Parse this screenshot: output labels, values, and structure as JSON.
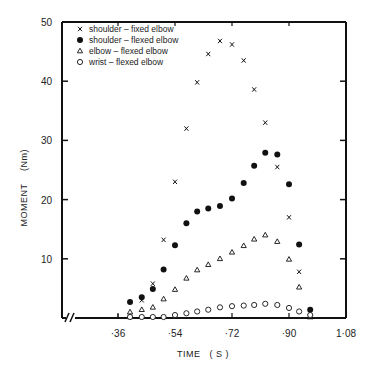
{
  "chart_data": {
    "type": "scatter",
    "title": "",
    "xlabel": "TIME   ( S )",
    "ylabel": "MOMENT     (Nm)",
    "xlim": [
      0.27,
      1.08
    ],
    "ylim": [
      0,
      50
    ],
    "x_ticks": [
      0.36,
      0.54,
      0.72,
      0.9,
      1.08
    ],
    "x_tick_labels": [
      "·36",
      "·54",
      "·72",
      "·90",
      "1·08"
    ],
    "y_ticks": [
      10,
      20,
      30,
      40,
      50
    ],
    "y_tick_labels": [
      "10",
      "20",
      "30",
      "40",
      "50"
    ],
    "axis_break": "x-axis broken near origin (//)",
    "grid": false,
    "legend_position": "upper left (inside)",
    "series": [
      {
        "name": "shoulder - fixed elbow",
        "marker": "x",
        "x": [
          0.398,
          0.435,
          0.47,
          0.504,
          0.54,
          0.576,
          0.61,
          0.645,
          0.682,
          0.72,
          0.757,
          0.79,
          0.825,
          0.863,
          0.9,
          0.932,
          0.967
        ],
        "y": [
          0.2,
          3.0,
          5.8,
          13.2,
          23.0,
          32.0,
          39.8,
          44.6,
          46.8,
          46.2,
          43.5,
          38.6,
          33.0,
          25.5,
          17.0,
          7.8,
          0.2
        ]
      },
      {
        "name": "shoulder - flexed elbow",
        "marker": "filled-circle",
        "x": [
          0.398,
          0.435,
          0.47,
          0.504,
          0.54,
          0.576,
          0.61,
          0.645,
          0.682,
          0.72,
          0.757,
          0.79,
          0.825,
          0.863,
          0.9,
          0.932,
          0.967
        ],
        "y": [
          2.7,
          3.5,
          4.9,
          8.2,
          12.3,
          16.0,
          18.0,
          18.5,
          18.9,
          20.2,
          22.8,
          25.7,
          27.9,
          27.6,
          22.6,
          12.4,
          1.4
        ]
      },
      {
        "name": "elbow - flexed elbow",
        "marker": "open-triangle",
        "x": [
          0.398,
          0.435,
          0.47,
          0.504,
          0.54,
          0.576,
          0.61,
          0.645,
          0.682,
          0.72,
          0.757,
          0.79,
          0.825,
          0.863,
          0.9,
          0.932,
          0.967
        ],
        "y": [
          1.0,
          1.4,
          1.8,
          3.2,
          4.8,
          6.7,
          8.1,
          9.0,
          10.0,
          11.1,
          12.2,
          13.3,
          14.0,
          12.9,
          9.9,
          5.2,
          0.0
        ]
      },
      {
        "name": "wrist - flexed elbow",
        "marker": "open-circle",
        "x": [
          0.398,
          0.435,
          0.47,
          0.504,
          0.54,
          0.576,
          0.61,
          0.645,
          0.682,
          0.72,
          0.757,
          0.79,
          0.825,
          0.863,
          0.9,
          0.932,
          0.967
        ],
        "y": [
          0.0,
          0.0,
          0.1,
          0.3,
          0.5,
          0.8,
          1.1,
          1.4,
          1.8,
          2.0,
          2.1,
          2.2,
          2.4,
          2.2,
          1.7,
          1.1,
          0.5
        ]
      }
    ]
  },
  "legend": {
    "items": [
      {
        "symbol": "×",
        "label": "shoulder  –  fixed elbow"
      },
      {
        "symbol": "●",
        "label": "shoulder  –  flexed elbow"
      },
      {
        "symbol": "▵",
        "label": "elbow     –  flexed elbow"
      },
      {
        "symbol": "○",
        "label": "wrist   –   flexed elbow"
      }
    ]
  },
  "axes": {
    "x_title": "TIME   ( S )",
    "y_title_main": "MOMENT",
    "y_title_unit": "(Nm)"
  },
  "colors": {
    "ink": "#111111",
    "background": "#ffffff"
  }
}
